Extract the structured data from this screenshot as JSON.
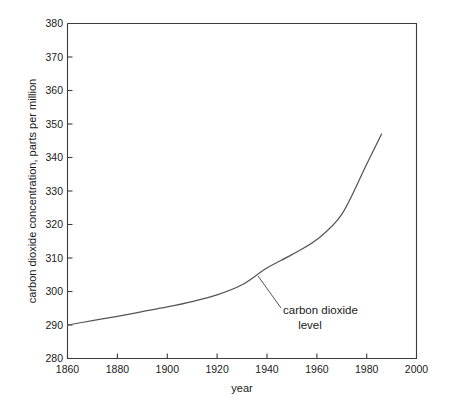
{
  "chart_data": {
    "type": "line",
    "title": "",
    "xlabel": "year",
    "ylabel": "carbon dioxide concentration, parts per million",
    "xlim": [
      1860,
      2000
    ],
    "ylim": [
      280,
      380
    ],
    "xticks": [
      1860,
      1880,
      1900,
      1920,
      1940,
      1960,
      1980,
      2000
    ],
    "yticks": [
      280,
      290,
      300,
      310,
      320,
      330,
      340,
      350,
      360,
      370,
      380
    ],
    "grid": false,
    "legend": null,
    "series": [
      {
        "name": "carbon dioxide level",
        "x": [
          1860,
          1870,
          1880,
          1890,
          1900,
          1910,
          1920,
          1930,
          1940,
          1950,
          1960,
          1970,
          1980,
          1986
        ],
        "values": [
          290.0,
          291.3,
          292.6,
          294.0,
          295.4,
          297.0,
          299.0,
          302.0,
          307.0,
          311.0,
          315.5,
          323.0,
          338.0,
          347.0
        ]
      }
    ],
    "annotations": [
      {
        "text_line1": "carbon dioxide",
        "text_line2": "level",
        "points_to_x": 1937,
        "points_to_y": 306.0
      }
    ],
    "colors": {
      "curve": "#555555",
      "axis": "#3c3c3c",
      "text": "#1a1a1a",
      "background": "#ffffff"
    }
  },
  "axis": {
    "x_tick_labels": [
      "1860",
      "1880",
      "1900",
      "1920",
      "1940",
      "1960",
      "1980",
      "2000"
    ],
    "y_tick_labels": [
      "280",
      "290",
      "300",
      "310",
      "320",
      "330",
      "340",
      "350",
      "360",
      "370",
      "380"
    ],
    "x_title": "year",
    "y_title": "carbon dioxide concentration, parts per million"
  },
  "annotation": {
    "line1": "carbon dioxide",
    "line2": "level"
  }
}
